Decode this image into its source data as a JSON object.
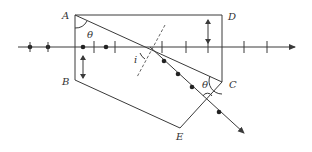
{
  "diagram": {
    "colors": {
      "stroke": "#3a3a3a",
      "dashed": "#666666",
      "text": "#333333"
    },
    "labels": {
      "A": "A",
      "B": "B",
      "C": "C",
      "D": "D",
      "E": "E",
      "theta_top": "θ",
      "theta_right": "θ",
      "incidence": "i"
    },
    "points": {
      "A": [
        75,
        15
      ],
      "D": [
        222,
        15
      ],
      "C": [
        222,
        82
      ],
      "B": [
        75,
        80
      ],
      "E": [
        180,
        128
      ]
    },
    "axis": {
      "y": 47,
      "x_start": 18,
      "x_end": 296,
      "dots_x": [
        30,
        48,
        83,
        106
      ],
      "ticks_x": [
        94,
        115,
        162,
        186,
        208,
        244,
        267
      ]
    },
    "refracted_ray": {
      "start": [
        150,
        47
      ],
      "end": [
        244,
        133
      ],
      "dots": [
        [
          164,
          61
        ],
        [
          178,
          74
        ],
        [
          192,
          87
        ],
        [
          219,
          112
        ]
      ]
    },
    "arrows": {
      "left_double": {
        "x": 83,
        "y1": 56,
        "y2": 77
      },
      "right_double": {
        "x": 208,
        "y1": 20,
        "y2": 42
      }
    }
  }
}
